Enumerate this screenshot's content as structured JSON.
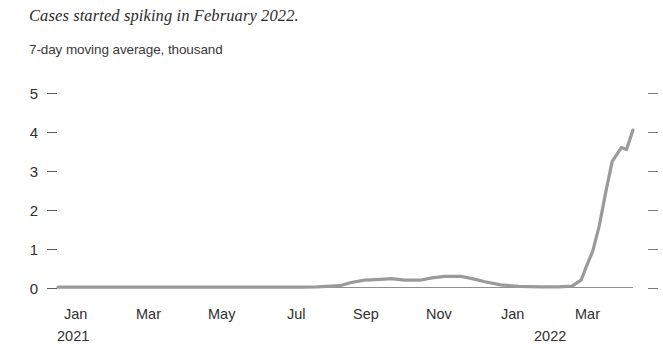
{
  "title": "Cases started spiking in February 2022.",
  "subtitle": "7-day moving average, thousand",
  "chart_data": {
    "type": "line",
    "title": "Cases started spiking in February 2022.",
    "subtitle": "7-day moving average, thousand",
    "xlabel": "",
    "ylabel": "7-day moving average, thousand",
    "ylim": [
      0,
      5
    ],
    "yticks": [
      "0",
      "1",
      "2",
      "3",
      "4",
      "5"
    ],
    "ytick_values": [
      0,
      1,
      2,
      3,
      4,
      5
    ],
    "grid": false,
    "legend": "none",
    "line_color": "#9a9a9a",
    "axis_color": "#5d5d5d",
    "xticks": [
      {
        "label": "Jan",
        "year": "2021"
      },
      {
        "label": "Mar",
        "year": ""
      },
      {
        "label": "May",
        "year": ""
      },
      {
        "label": "Jul",
        "year": ""
      },
      {
        "label": "Sep",
        "year": ""
      },
      {
        "label": "Nov",
        "year": ""
      },
      {
        "label": "Jan",
        "year": "2022"
      },
      {
        "label": "Mar",
        "year": ""
      }
    ],
    "xlim": [
      "2021-01",
      "2022-03"
    ],
    "series": [
      {
        "name": "7-day moving average, thousand",
        "x": [
          "2021-01-01",
          "2021-01-15",
          "2021-02-01",
          "2021-02-15",
          "2021-03-01",
          "2021-03-15",
          "2021-04-01",
          "2021-04-15",
          "2021-05-01",
          "2021-05-15",
          "2021-06-01",
          "2021-06-15",
          "2021-07-01",
          "2021-07-15",
          "2021-08-01",
          "2021-08-10",
          "2021-08-20",
          "2021-09-01",
          "2021-09-10",
          "2021-09-20",
          "2021-10-01",
          "2021-10-10",
          "2021-10-20",
          "2021-11-01",
          "2021-11-10",
          "2021-11-20",
          "2021-12-01",
          "2021-12-15",
          "2022-01-01",
          "2022-01-15",
          "2022-01-25",
          "2022-02-01",
          "2022-02-05",
          "2022-02-10",
          "2022-02-15",
          "2022-02-20",
          "2022-02-25",
          "2022-03-01",
          "2022-03-05",
          "2022-03-10"
        ],
        "values": [
          0.02,
          0.02,
          0.02,
          0.02,
          0.02,
          0.02,
          0.02,
          0.02,
          0.02,
          0.02,
          0.02,
          0.02,
          0.02,
          0.03,
          0.06,
          0.14,
          0.2,
          0.22,
          0.24,
          0.2,
          0.2,
          0.26,
          0.3,
          0.3,
          0.24,
          0.16,
          0.08,
          0.04,
          0.03,
          0.03,
          0.05,
          0.2,
          0.55,
          0.95,
          1.6,
          2.45,
          3.25,
          3.6,
          3.55,
          4.05
        ]
      }
    ],
    "annotations": [
      {
        "text": "flat near zero through 2021",
        "value": 0.02
      },
      {
        "text": "small wave Sep-Nov 2021 peaking near 0.3",
        "value": 0.3
      },
      {
        "text": "sharp spike February 2022 reaching about 4",
        "value": 4.05
      }
    ]
  }
}
